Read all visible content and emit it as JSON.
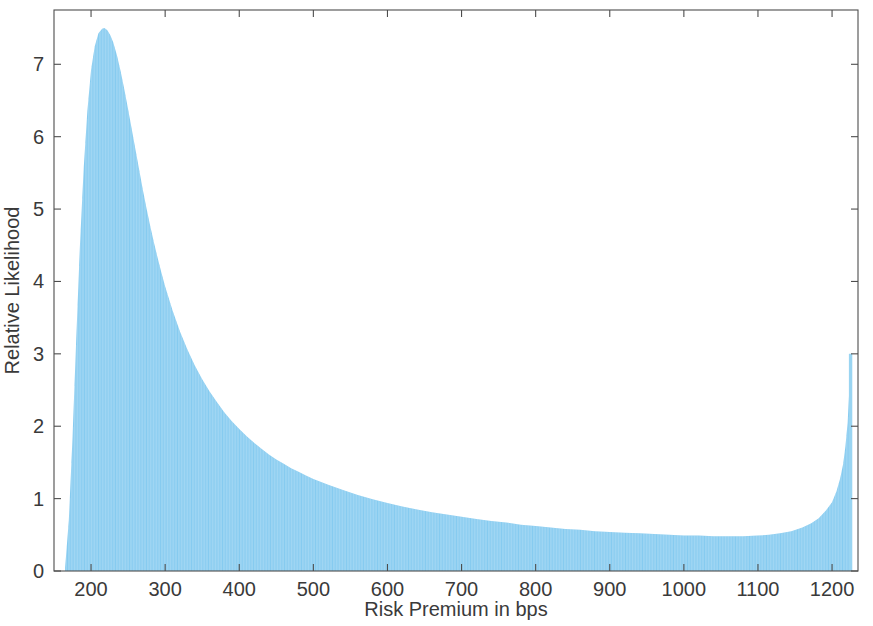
{
  "chart_data": {
    "type": "bar",
    "title": "",
    "subtitle": "",
    "xlabel": "Risk Premium in bps",
    "ylabel": "Relative Likelihood",
    "xlim": [
      150,
      1235
    ],
    "ylim": [
      0,
      7.75
    ],
    "xticks": [
      200,
      300,
      400,
      500,
      600,
      700,
      800,
      900,
      1000,
      1100,
      1200
    ],
    "xticklabels": [
      "200",
      "300",
      "400",
      "500",
      "600",
      "700",
      "800",
      "900",
      "1000",
      "1100",
      "1200"
    ],
    "yticks": [
      0,
      1,
      2,
      3,
      4,
      5,
      6,
      7
    ],
    "yticklabels": [
      "0",
      "1",
      "2",
      "3",
      "4",
      "5",
      "6",
      "7"
    ],
    "grid": false,
    "legend": null,
    "fill_color": "#86cbf0",
    "axis_color": "#4d4d4d",
    "text_color": "#3a3a3a",
    "background_color": "#ffffff",
    "peak": {
      "x": 218,
      "y": 7.5
    },
    "terminal_spike": {
      "x": 1225,
      "y": 3.0
    },
    "x": [
      165,
      170,
      175,
      180,
      185,
      190,
      195,
      200,
      205,
      210,
      215,
      218,
      222,
      226,
      230,
      235,
      240,
      245,
      250,
      255,
      260,
      265,
      270,
      275,
      280,
      285,
      290,
      295,
      300,
      310,
      320,
      330,
      340,
      350,
      360,
      370,
      380,
      390,
      400,
      410,
      420,
      430,
      440,
      450,
      460,
      470,
      480,
      490,
      500,
      520,
      540,
      560,
      580,
      600,
      620,
      640,
      660,
      680,
      700,
      720,
      740,
      760,
      780,
      800,
      820,
      840,
      860,
      880,
      900,
      920,
      940,
      960,
      980,
      1000,
      1020,
      1040,
      1060,
      1080,
      1100,
      1115,
      1130,
      1145,
      1160,
      1172,
      1182,
      1192,
      1200,
      1206,
      1211,
      1215,
      1218,
      1221,
      1223,
      1224,
      1225
    ],
    "values": [
      0.05,
      0.7,
      1.85,
      3.2,
      4.5,
      5.55,
      6.35,
      6.92,
      7.25,
      7.43,
      7.49,
      7.5,
      7.47,
      7.4,
      7.3,
      7.12,
      6.9,
      6.65,
      6.38,
      6.1,
      5.82,
      5.54,
      5.26,
      5.0,
      4.76,
      4.53,
      4.32,
      4.12,
      3.93,
      3.6,
      3.31,
      3.06,
      2.84,
      2.65,
      2.48,
      2.33,
      2.19,
      2.07,
      1.96,
      1.86,
      1.77,
      1.69,
      1.61,
      1.54,
      1.48,
      1.42,
      1.37,
      1.32,
      1.27,
      1.19,
      1.12,
      1.05,
      0.99,
      0.94,
      0.89,
      0.85,
      0.81,
      0.78,
      0.75,
      0.72,
      0.69,
      0.67,
      0.64,
      0.62,
      0.6,
      0.58,
      0.57,
      0.55,
      0.54,
      0.53,
      0.52,
      0.51,
      0.5,
      0.49,
      0.49,
      0.48,
      0.48,
      0.48,
      0.49,
      0.5,
      0.52,
      0.55,
      0.6,
      0.66,
      0.73,
      0.84,
      0.95,
      1.1,
      1.28,
      1.48,
      1.72,
      2.05,
      2.45,
      2.8,
      3.0
    ]
  }
}
